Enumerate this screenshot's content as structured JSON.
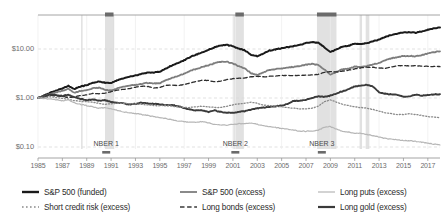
{
  "chart_data": {
    "type": "line",
    "title": "",
    "subtitle": "",
    "xlabel": "",
    "ylabel": "",
    "yscale": "log",
    "ylim": [
      0.05,
      30
    ],
    "xlim": [
      1985,
      2018
    ],
    "grid": true,
    "legend_position": "bottom",
    "y_ticks": [
      "$10.00",
      "$1.00",
      "$0.10"
    ],
    "y_tick_values": [
      10,
      1,
      0.1
    ],
    "x_ticks": [
      "1985",
      "1987",
      "1989",
      "1991",
      "1993",
      "1995",
      "1997",
      "1999",
      "2001",
      "2003",
      "2005",
      "2007",
      "2009",
      "2011",
      "2013",
      "2015",
      "2017"
    ],
    "x_tick_values": [
      1985,
      1987,
      1989,
      1991,
      1993,
      1995,
      1997,
      1999,
      2001,
      2003,
      2005,
      2007,
      2009,
      2011,
      2013,
      2015,
      2017
    ],
    "annotations": [
      {
        "label": "NBER 1",
        "x": 1990.6
      },
      {
        "label": "NBER 2",
        "x": 2001.2
      },
      {
        "label": "NBER 3",
        "x": 2008.3
      }
    ],
    "recession_bands": [
      {
        "name": "NBER 1",
        "start": 1990.5,
        "end": 1991.2
      },
      {
        "name": "NBER 2",
        "start": 2001.2,
        "end": 2001.9
      },
      {
        "name": "NBER 3",
        "start": 2007.9,
        "end": 2009.5
      },
      {
        "name": "band-4",
        "start": 2011.4,
        "end": 2011.6
      },
      {
        "name": "band-5",
        "start": 2011.9,
        "end": 2012.2
      }
    ],
    "x": [
      1985.0,
      1985.5,
      1986.0,
      1986.5,
      1987.0,
      1987.5,
      1988.0,
      1988.5,
      1989.0,
      1989.5,
      1990.0,
      1990.5,
      1991.0,
      1991.5,
      1992.0,
      1992.5,
      1993.0,
      1993.5,
      1994.0,
      1994.5,
      1995.0,
      1995.5,
      1996.0,
      1996.5,
      1997.0,
      1997.5,
      1998.0,
      1998.5,
      1999.0,
      1999.5,
      2000.0,
      2000.5,
      2001.0,
      2001.5,
      2002.0,
      2002.5,
      2003.0,
      2003.5,
      2004.0,
      2004.5,
      2005.0,
      2005.5,
      2006.0,
      2006.5,
      2007.0,
      2007.5,
      2008.0,
      2008.5,
      2009.0,
      2009.5,
      2010.0,
      2010.5,
      2011.0,
      2011.5,
      2012.0,
      2012.5,
      2013.0,
      2013.5,
      2014.0,
      2014.5,
      2015.0,
      2015.5,
      2016.0,
      2016.5,
      2017.0,
      2017.5,
      2018.0
    ],
    "series": [
      {
        "name": "S&P 500 (funded)",
        "style": "solid",
        "color": "#1a1a1a",
        "width": 2.0,
        "values": [
          1.0,
          1.12,
          1.28,
          1.42,
          1.58,
          1.78,
          1.52,
          1.72,
          1.82,
          2.05,
          2.18,
          2.05,
          2.02,
          2.3,
          2.52,
          2.72,
          2.88,
          3.1,
          3.3,
          3.32,
          3.42,
          4.0,
          4.6,
          5.2,
          5.9,
          6.9,
          7.7,
          8.6,
          9.6,
          10.8,
          11.8,
          12.2,
          11.4,
          10.2,
          9.3,
          7.6,
          7.1,
          8.1,
          9.3,
          9.8,
          10.3,
          10.9,
          11.5,
          12.2,
          13.2,
          13.9,
          13.4,
          11.0,
          8.6,
          9.8,
          11.3,
          11.6,
          12.9,
          12.6,
          13.2,
          14.3,
          15.6,
          17.6,
          19.4,
          20.6,
          21.8,
          21.9,
          21.4,
          23.0,
          24.6,
          26.4,
          27.6
        ]
      },
      {
        "name": "S&P 500 (excess)",
        "style": "solid",
        "color": "#7d7d7d",
        "width": 1.8,
        "values": [
          1.0,
          1.08,
          1.2,
          1.3,
          1.4,
          1.54,
          1.28,
          1.4,
          1.44,
          1.58,
          1.62,
          1.48,
          1.42,
          1.58,
          1.69,
          1.78,
          1.84,
          1.94,
          2.02,
          1.98,
          2.0,
          2.3,
          2.58,
          2.84,
          3.14,
          3.6,
          3.92,
          4.28,
          4.66,
          5.14,
          5.48,
          5.54,
          5.06,
          4.44,
          3.98,
          3.2,
          2.94,
          3.32,
          3.76,
          3.9,
          4.02,
          4.18,
          4.34,
          4.52,
          4.8,
          4.96,
          4.72,
          3.84,
          2.98,
          3.38,
          3.88,
          3.96,
          4.38,
          4.26,
          4.46,
          4.82,
          5.24,
          5.88,
          6.46,
          6.82,
          7.2,
          7.22,
          7.04,
          7.54,
          8.04,
          8.6,
          8.96
        ]
      },
      {
        "name": "Long bonds (excess)",
        "style": "dashed",
        "color": "#2e2e2e",
        "width": 1.3,
        "values": [
          1.0,
          1.05,
          1.14,
          1.1,
          1.08,
          1.02,
          1.06,
          1.12,
          1.16,
          1.24,
          1.22,
          1.26,
          1.34,
          1.44,
          1.5,
          1.56,
          1.66,
          1.74,
          1.72,
          1.6,
          1.64,
          1.82,
          1.84,
          1.8,
          1.88,
          2.04,
          2.16,
          2.32,
          2.28,
          2.14,
          2.2,
          2.38,
          2.48,
          2.52,
          2.56,
          2.74,
          2.76,
          2.7,
          2.76,
          2.82,
          2.88,
          2.88,
          2.86,
          2.9,
          2.92,
          2.94,
          3.02,
          3.34,
          3.46,
          3.4,
          3.52,
          3.7,
          3.94,
          4.12,
          4.24,
          4.24,
          4.08,
          4.02,
          4.28,
          4.56,
          4.58,
          4.5,
          4.56,
          4.48,
          4.42,
          4.4,
          4.38
        ]
      },
      {
        "name": "Long gold (excess)",
        "style": "solid",
        "color": "#3a3a3a",
        "width": 1.9,
        "values": [
          1.0,
          1.06,
          1.18,
          1.14,
          1.1,
          1.16,
          1.04,
          0.96,
          0.9,
          0.94,
          0.88,
          0.9,
          0.84,
          0.8,
          0.78,
          0.74,
          0.76,
          0.8,
          0.78,
          0.76,
          0.74,
          0.72,
          0.72,
          0.68,
          0.62,
          0.58,
          0.56,
          0.56,
          0.52,
          0.56,
          0.52,
          0.5,
          0.5,
          0.52,
          0.54,
          0.58,
          0.62,
          0.64,
          0.66,
          0.68,
          0.7,
          0.76,
          0.88,
          0.88,
          0.92,
          1.0,
          1.08,
          1.06,
          1.12,
          1.24,
          1.38,
          1.52,
          1.72,
          1.78,
          1.84,
          1.72,
          1.3,
          1.22,
          1.18,
          1.16,
          1.06,
          1.08,
          1.16,
          1.12,
          1.14,
          1.18,
          1.2
        ]
      },
      {
        "name": "Short credit risk (excess)",
        "style": "dotted",
        "color": "#8a8a8a",
        "width": 1.3,
        "values": [
          1.0,
          1.02,
          1.06,
          1.02,
          0.98,
          0.94,
          0.88,
          0.86,
          0.84,
          0.82,
          0.78,
          0.74,
          0.76,
          0.78,
          0.78,
          0.76,
          0.76,
          0.74,
          0.72,
          0.7,
          0.7,
          0.7,
          0.68,
          0.66,
          0.64,
          0.64,
          0.66,
          0.68,
          0.66,
          0.64,
          0.64,
          0.68,
          0.72,
          0.76,
          0.78,
          0.82,
          0.78,
          0.72,
          0.7,
          0.68,
          0.66,
          0.64,
          0.62,
          0.6,
          0.6,
          0.62,
          0.68,
          0.84,
          0.92,
          0.82,
          0.74,
          0.7,
          0.66,
          0.64,
          0.62,
          0.58,
          0.54,
          0.5,
          0.48,
          0.46,
          0.46,
          0.48,
          0.46,
          0.44,
          0.42,
          0.41,
          0.4
        ]
      },
      {
        "name": "Long puts (excess)",
        "style": "solid",
        "color": "#b6b6b6",
        "width": 1.2,
        "values": [
          1.0,
          0.98,
          0.96,
          0.92,
          0.88,
          0.92,
          0.8,
          0.74,
          0.7,
          0.66,
          0.62,
          0.64,
          0.6,
          0.56,
          0.52,
          0.5,
          0.48,
          0.46,
          0.44,
          0.42,
          0.4,
          0.38,
          0.36,
          0.34,
          0.33,
          0.32,
          0.32,
          0.33,
          0.31,
          0.29,
          0.28,
          0.28,
          0.29,
          0.3,
          0.3,
          0.31,
          0.29,
          0.27,
          0.26,
          0.25,
          0.24,
          0.23,
          0.22,
          0.21,
          0.21,
          0.21,
          0.22,
          0.25,
          0.26,
          0.23,
          0.21,
          0.2,
          0.19,
          0.19,
          0.18,
          0.17,
          0.16,
          0.15,
          0.145,
          0.14,
          0.135,
          0.135,
          0.13,
          0.125,
          0.12,
          0.115,
          0.11
        ]
      }
    ]
  },
  "legend": {
    "items": [
      {
        "label": "S&P 500 (funded)",
        "style": "solid",
        "color": "#1a1a1a",
        "width": 2.4
      },
      {
        "label": "Short credit risk (excess)",
        "style": "dotted",
        "color": "#8a8a8a",
        "width": 1.6
      },
      {
        "label": "S&P 500 (excess)",
        "style": "solid",
        "color": "#7d7d7d",
        "width": 1.8
      },
      {
        "label": "Long bonds (excess)",
        "style": "dashed",
        "color": "#3a3a3a",
        "width": 1.5
      },
      {
        "label": "Long puts (excess)",
        "style": "solid",
        "color": "#b6b6b6",
        "width": 1.2
      },
      {
        "label": "Long gold (excess)",
        "style": "solid",
        "color": "#3a3a3a",
        "width": 2.2
      }
    ]
  },
  "colors": {
    "grid": "#d9d9d9",
    "axis": "#9a9a9a",
    "recession_band": "#dcdcdc",
    "recession_marker": "#6b6b6b",
    "tick_text": "#6d6d6d"
  }
}
